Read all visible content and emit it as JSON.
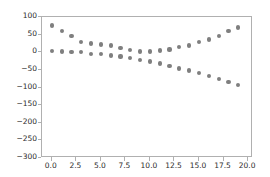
{
  "figure": {
    "width": 270,
    "height": 177,
    "background_color": "#ffffff",
    "axes_edge_color": "#b0b0b0",
    "tick_label_color": "#2b2b2b"
  },
  "chart_data": {
    "type": "scatter",
    "title": "",
    "xlabel": "",
    "ylabel": "",
    "xlim": [
      -1.0,
      20.5
    ],
    "ylim": [
      -300,
      100
    ],
    "grid": false,
    "legend": null,
    "marker": "circle",
    "marker_color": "#7f7f7f",
    "marker_size": 4,
    "xticks": [
      0.0,
      2.5,
      5.0,
      7.5,
      10.0,
      12.5,
      15.0,
      17.5,
      20.0
    ],
    "xtick_labels": [
      "0.0",
      "2.5",
      "5.0",
      "7.5",
      "10.0",
      "12.5",
      "15.0",
      "17.5",
      "20.0"
    ],
    "yticks": [
      100,
      50,
      0,
      -50,
      -100,
      -150,
      -200,
      -250,
      -300
    ],
    "ytick_labels": [
      "100",
      "50",
      "0",
      "−50",
      "−100",
      "−150",
      "−200",
      "−250",
      "−300"
    ],
    "x": [
      0,
      1,
      2,
      3,
      4,
      5,
      6,
      7,
      8,
      9,
      10,
      11,
      12,
      13,
      14,
      15,
      16,
      17,
      18,
      19
    ],
    "series": [
      {
        "name": "series-1",
        "color": "#7f7f7f",
        "values": [
          76,
          60,
          46,
          30,
          25,
          22,
          19,
          13,
          6,
          2,
          2,
          5,
          8,
          14,
          19,
          30,
          36,
          45,
          60,
          70
        ]
      },
      {
        "name": "series-2",
        "color": "#7f7f7f",
        "values": [
          3,
          2,
          1,
          0,
          -4,
          -6,
          -9,
          -12,
          -16,
          -21,
          -26,
          -32,
          -38,
          -46,
          -52,
          -58,
          -68,
          -76,
          -84,
          -94
        ]
      }
    ]
  }
}
